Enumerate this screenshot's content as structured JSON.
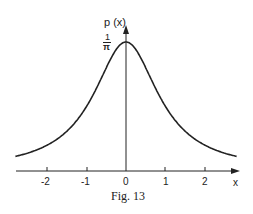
{
  "chart_data": {
    "type": "line",
    "title": "",
    "caption": "Fig. 13",
    "xlabel": "x",
    "ylabel": "p (x)",
    "function": "p(x) = 1 / (pi * (1 + x^2))",
    "x_ticks": [
      -2,
      -1,
      0,
      1,
      2
    ],
    "x_tick_labels": [
      "-2",
      "-1",
      "0",
      "1",
      "2"
    ],
    "y_tick_labels": [
      {
        "numerator": "1",
        "denominator": "π",
        "value": 0.3183
      }
    ],
    "xlim": [
      -2.8,
      2.8
    ],
    "ylim": [
      0,
      0.3183
    ],
    "grid": false,
    "series": [
      {
        "name": "p(x)",
        "x": [
          -2.8,
          -2.5,
          -2,
          -1.5,
          -1,
          -0.5,
          0,
          0.5,
          1,
          1.5,
          2,
          2.5,
          2.8
        ],
        "values": [
          0.036,
          0.044,
          0.064,
          0.098,
          0.159,
          0.255,
          0.318,
          0.255,
          0.159,
          0.098,
          0.064,
          0.044,
          0.036
        ]
      }
    ]
  },
  "labels": {
    "ylabel": "p (x)",
    "ytick_num": "1",
    "ytick_den": "π",
    "xlabel": "x",
    "ticks": [
      "-2",
      "-1",
      "0",
      "1",
      "2"
    ],
    "caption": "Fig. 13"
  }
}
